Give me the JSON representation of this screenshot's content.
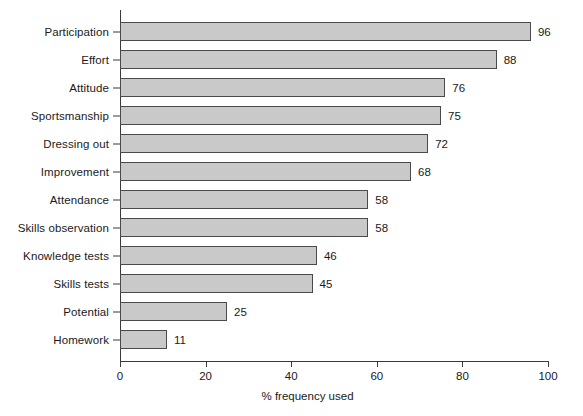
{
  "chart_data": {
    "type": "bar",
    "orientation": "horizontal",
    "title": "",
    "xlabel": "% frequency used",
    "ylabel": "",
    "xlim": [
      0,
      100
    ],
    "xticks": [
      0,
      20,
      40,
      60,
      80,
      100
    ],
    "xtick_labels": [
      "0",
      "20",
      "40",
      "60",
      "80",
      "100"
    ],
    "grid": false,
    "legend": null,
    "bar_fill_color": "#c9c9c9",
    "bar_edge_color": "#4a4a4a",
    "axis_color": "#3a3a3a",
    "background_color": "#ffffff",
    "categories": [
      "Participation",
      "Effort",
      "Attitude",
      "Sportsmanship",
      "Dressing out",
      "Improvement",
      "Attendance",
      "Skills observation",
      "Knowledge tests",
      "Skills tests",
      "Potential",
      "Homework"
    ],
    "values": [
      96,
      88,
      76,
      75,
      72,
      68,
      58,
      58,
      46,
      45,
      25,
      11
    ],
    "data_labels": [
      "96",
      "88",
      "76",
      "75",
      "72",
      "68",
      "58",
      "58",
      "46",
      "45",
      "25",
      "11"
    ],
    "points": [
      {
        "category": "Participation",
        "value": 96,
        "label": "96"
      },
      {
        "category": "Effort",
        "value": 88,
        "label": "88"
      },
      {
        "category": "Attitude",
        "value": 76,
        "label": "76"
      },
      {
        "category": "Sportsmanship",
        "value": 75,
        "label": "75"
      },
      {
        "category": "Dressing out",
        "value": 72,
        "label": "72"
      },
      {
        "category": "Improvement",
        "value": 68,
        "label": "68"
      },
      {
        "category": "Attendance",
        "value": 58,
        "label": "58"
      },
      {
        "category": "Skills observation",
        "value": 58,
        "label": "58"
      },
      {
        "category": "Knowledge tests",
        "value": 46,
        "label": "46"
      },
      {
        "category": "Skills tests",
        "value": 45,
        "label": "45"
      },
      {
        "category": "Potential",
        "value": 25,
        "label": "25"
      },
      {
        "category": "Homework",
        "value": 11,
        "label": "11"
      }
    ]
  }
}
